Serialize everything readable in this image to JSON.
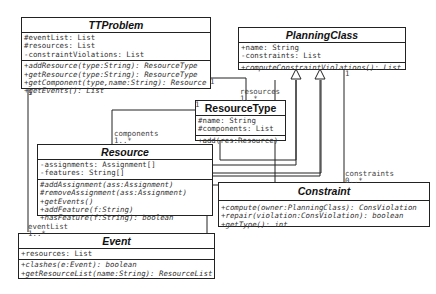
{
  "classes": {
    "ttproblem": {
      "name": "TTProblem",
      "attributes": [
        "#eventList: List",
        "#resources: List",
        "-constraintViolations: List"
      ],
      "operations": [
        "+addResource(type:String): ResourceType",
        "+getResource(type:String): ResourceType",
        "+getComponent(type,name:String): Resource",
        "+getEvents(): List"
      ]
    },
    "planningclass": {
      "name": "PlanningClass",
      "attributes": [
        "+name: String",
        "-constraints: List"
      ],
      "operations": [
        "+computeConstraintViolations(): List"
      ]
    },
    "resourcetype": {
      "name": "ResourceType",
      "attributes": [
        "#name: String",
        "#components: List"
      ],
      "operations": [
        "+add(res:Resource)"
      ]
    },
    "resource": {
      "name": "Resource",
      "attributes": [
        "-assignments: Assignment[]",
        "-features: String[]"
      ],
      "operations": [
        "#addAssignment(ass:Assignment)",
        "#removeAssignment(ass:Assignment)",
        "+getEvents()",
        "+addFeature(f:String)",
        "+hasFeature(f:String): boolean"
      ]
    },
    "constraint": {
      "name": "Constraint",
      "attributes": [],
      "operations": [
        "+compute(owner:PlanningClass): ConsViolation",
        "+repair(violation:ConsViolation): boolean",
        "+getType(): int"
      ]
    },
    "event": {
      "name": "Event",
      "attributes": [
        "+resources: List"
      ],
      "operations": [
        "+clashes(e:Event): boolean",
        "+getResourceList(name:String): ResourceList"
      ]
    }
  },
  "associations": {
    "resources": {
      "role": "resources",
      "mult_far": "1..*",
      "mult_near": "1"
    },
    "components": {
      "role": "components",
      "mult_far": "1..*",
      "mult_near": "1"
    },
    "constraints": {
      "role": "constraints",
      "mult_far": "0..*",
      "mult_near": "1"
    },
    "eventList": {
      "role": "eventList",
      "mult_far": "1..*",
      "mult_near": "1"
    }
  },
  "colors": {
    "line": "#222222",
    "text": "#333333",
    "background": "#ffffff"
  }
}
